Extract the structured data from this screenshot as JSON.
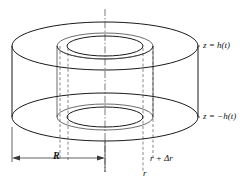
{
  "figure": {
    "name": "cylindrical-annulus-control-volume",
    "background_color": "#ffffff",
    "line_color": "#1a1a1a",
    "dashed_color": "#555555",
    "labels": {
      "z_top": "z = h(t)",
      "z_bottom": "z = −h(t)",
      "radius_outer": "R",
      "radius_inner": "r",
      "radius_inner_plus": "r + Δr"
    }
  },
  "geometry": {
    "center_x": 105,
    "top_disk_center_y": 46,
    "bottom_disk_center_y": 117,
    "outer_radius_x": 93,
    "outer_radius_y": 24,
    "inner_outer_radius_x": 48,
    "inner_outer_radius_y": 13,
    "inner_inner_radius_x": 38,
    "inner_inner_radius_y": 10,
    "outer_left_x": 12,
    "outer_right_x": 198,
    "dash_left_inner_x": 60,
    "dash_left_mid_x": 68,
    "dash_right_mid_x": 143,
    "dash_right_outer_x": 153,
    "axis_top_y": 9,
    "axis_bottom_y": 172,
    "dimension_line_y": 158
  }
}
